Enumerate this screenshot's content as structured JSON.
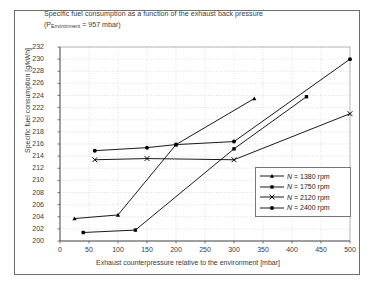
{
  "chart_data": {
    "type": "line",
    "title": "Specific fuel consumption as a function of the exhaust back pressure",
    "subtitle_prefix": "(P",
    "subtitle_sub": "Environment",
    "subtitle_suffix": " = 957 mbar)",
    "xlabel": "Exhaust counterpressure relative to the environment [mbar]",
    "ylabel": "Specific fuel consumption [g/kWh]",
    "xlim": [
      0,
      500
    ],
    "ylim": [
      200,
      232
    ],
    "xticks": [
      0,
      50,
      100,
      150,
      200,
      250,
      300,
      350,
      400,
      450,
      500
    ],
    "yticks": [
      200,
      202,
      204,
      206,
      208,
      210,
      212,
      214,
      216,
      218,
      220,
      222,
      224,
      226,
      228,
      230,
      232
    ],
    "grid": true,
    "legend_position": "lower-right-inside",
    "line_color": "#000000",
    "series": [
      {
        "name": "N = 1380 rpm",
        "label_var": "N",
        "label_rest": " = 1380 rpm",
        "marker": "triangle",
        "x": [
          25,
          100,
          200,
          335
        ],
        "y": [
          203.7,
          204.3,
          215.9,
          223.5
        ]
      },
      {
        "name": "N = 1750 rpm",
        "label_var": "N",
        "label_rest": " = 1750 rpm",
        "marker": "square",
        "x": [
          40,
          130,
          300,
          425
        ],
        "y": [
          201.4,
          201.8,
          215.2,
          223.8
        ]
      },
      {
        "name": "N = 2120 rpm",
        "label_var": "N",
        "label_rest": " = 2120 rpm",
        "marker": "cross",
        "x": [
          60,
          150,
          300,
          500
        ],
        "y": [
          213.4,
          213.6,
          213.4,
          221.0
        ]
      },
      {
        "name": "N = 2400 rpm",
        "label_var": "N",
        "label_rest": " = 2400 rpm",
        "marker": "circle",
        "x": [
          60,
          150,
          200,
          300,
          500
        ],
        "y": [
          214.9,
          215.4,
          215.9,
          216.4,
          230.0
        ]
      }
    ]
  }
}
